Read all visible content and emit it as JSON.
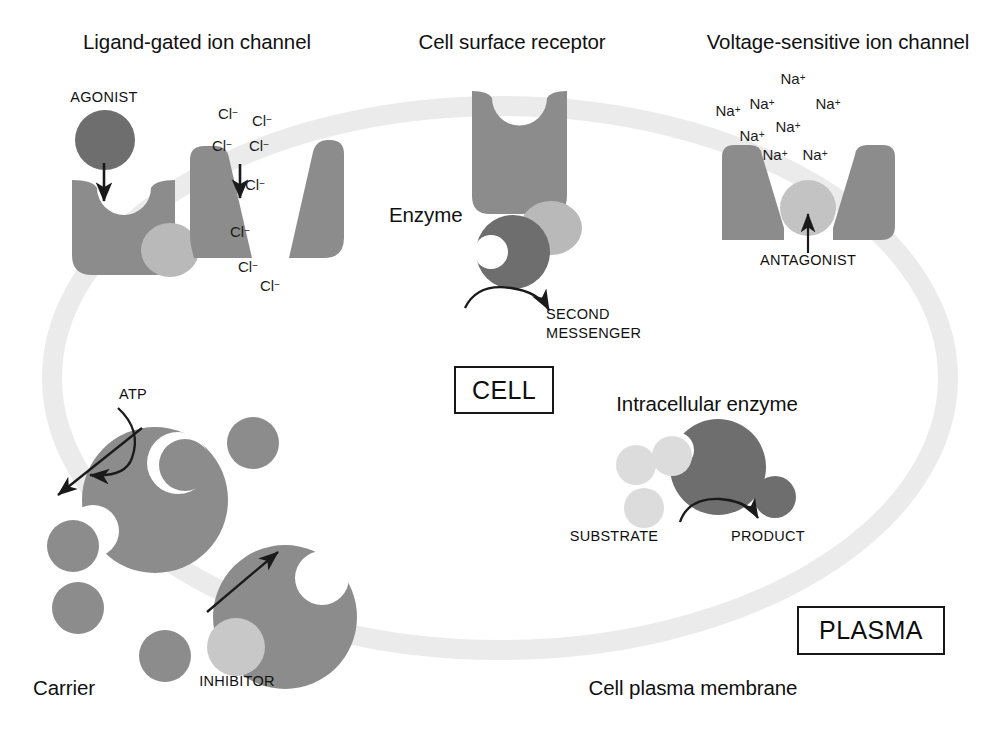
{
  "figure": {
    "kind": "cell-drug-targets-diagram",
    "background": "#ffffff"
  },
  "palette": {
    "dark_gray": "#6e6e6e",
    "medium_gray": "#8c8c8c",
    "light_gray": "#b9b9b9",
    "pale_gray": "#d8d8d8",
    "membrane_gray": "#ebebeb",
    "stroke_black": "#1a1a1a",
    "text_black": "#111111",
    "white": "#ffffff"
  },
  "titles": {
    "ligand_gated": "Ligand-gated ion channel",
    "cell_surface_receptor": "Cell surface receptor",
    "voltage_sensitive": "Voltage-sensitive ion channel",
    "intracellular_enzyme": "Intracellular enzyme",
    "carrier": "Carrier",
    "cell_plasma_membrane": "Cell plasma membrane",
    "enzyme": "Enzyme"
  },
  "boxes": {
    "cell": "CELL",
    "plasma": "PLASMA"
  },
  "labels": {
    "agonist": "AGONIST",
    "antagonist": "ANTAGONIST",
    "inhibitor": "INHIBITOR",
    "atp": "ATP",
    "substrate": "SUBSTRATE",
    "product": "PRODUCT",
    "second_messenger_line1": "SECOND",
    "second_messenger_line2": "MESSENGER"
  },
  "ions": {
    "chloride_symbol": "Cl",
    "chloride_charge": "−",
    "sodium_symbol": "Na",
    "sodium_charge": "+",
    "chloride_positions": [
      {
        "x": 228,
        "y": 105
      },
      {
        "x": 262,
        "y": 112
      },
      {
        "x": 222,
        "y": 137
      },
      {
        "x": 259,
        "y": 137
      },
      {
        "x": 255,
        "y": 176
      },
      {
        "x": 240,
        "y": 223
      },
      {
        "x": 248,
        "y": 258
      },
      {
        "x": 270,
        "y": 277
      }
    ],
    "sodium_positions": [
      {
        "x": 793,
        "y": 70
      },
      {
        "x": 762,
        "y": 95
      },
      {
        "x": 728,
        "y": 102
      },
      {
        "x": 828,
        "y": 95
      },
      {
        "x": 788,
        "y": 118
      },
      {
        "x": 752,
        "y": 127
      },
      {
        "x": 775,
        "y": 146
      },
      {
        "x": 815,
        "y": 146
      }
    ]
  },
  "chloride_count": 8,
  "sodium_count": 8
}
